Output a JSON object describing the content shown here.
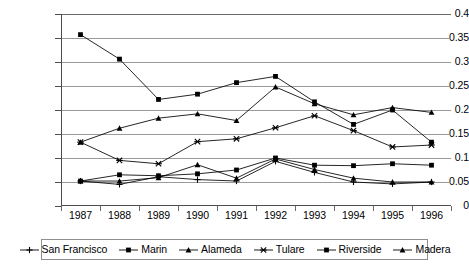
{
  "chart_data": {
    "type": "line",
    "title": "",
    "xlabel": "",
    "ylabel": "",
    "categories": [
      "1987",
      "1988",
      "1989",
      "1990",
      "1991",
      "1992",
      "1993",
      "1994",
      "1995",
      "1996"
    ],
    "x": [
      1987,
      1988,
      1989,
      1990,
      1991,
      1992,
      1993,
      1994,
      1995,
      1996
    ],
    "ylim": [
      0,
      0.4
    ],
    "yticks": [
      "0",
      "0.05",
      "0.1",
      "0.15",
      "0.2",
      "0.25",
      "0.3",
      "0.35",
      "0.4"
    ],
    "ytick_values": [
      0,
      0.05,
      0.1,
      0.15,
      0.2,
      0.25,
      0.3,
      0.35,
      0.4
    ],
    "grid": true,
    "legend_position": "bottom",
    "series": [
      {
        "name": "San Francisco",
        "marker": "plus",
        "values": [
          0.052,
          0.045,
          0.061,
          0.055,
          0.052,
          0.093,
          0.07,
          0.05,
          0.046,
          0.05
        ]
      },
      {
        "name": "Marin",
        "marker": "square",
        "values": [
          0.052,
          0.065,
          0.063,
          0.067,
          0.075,
          0.1,
          0.085,
          0.084,
          0.088,
          0.085
        ]
      },
      {
        "name": "Alameda",
        "marker": "triangle",
        "values": [
          0.133,
          0.162,
          0.183,
          0.192,
          0.178,
          0.248,
          0.213,
          0.19,
          0.205,
          0.195
        ]
      },
      {
        "name": "Tulare",
        "marker": "cross",
        "values": [
          0.133,
          0.095,
          0.088,
          0.134,
          0.14,
          0.163,
          0.188,
          0.157,
          0.123,
          0.127
        ]
      },
      {
        "name": "Riverside",
        "marker": "filled-square",
        "values": [
          0.357,
          0.306,
          0.222,
          0.233,
          0.257,
          0.27,
          0.217,
          0.17,
          0.2,
          0.133
        ]
      },
      {
        "name": "Madera",
        "marker": "filled-triangle",
        "values": [
          0.052,
          0.052,
          0.059,
          0.086,
          0.058,
          0.098,
          0.076,
          0.058,
          0.05,
          0.05
        ]
      }
    ],
    "colors": {
      "line": "#000000",
      "grid": "#9a9a9a",
      "axis": "#4d4d4d",
      "background": "#ffffff"
    }
  }
}
